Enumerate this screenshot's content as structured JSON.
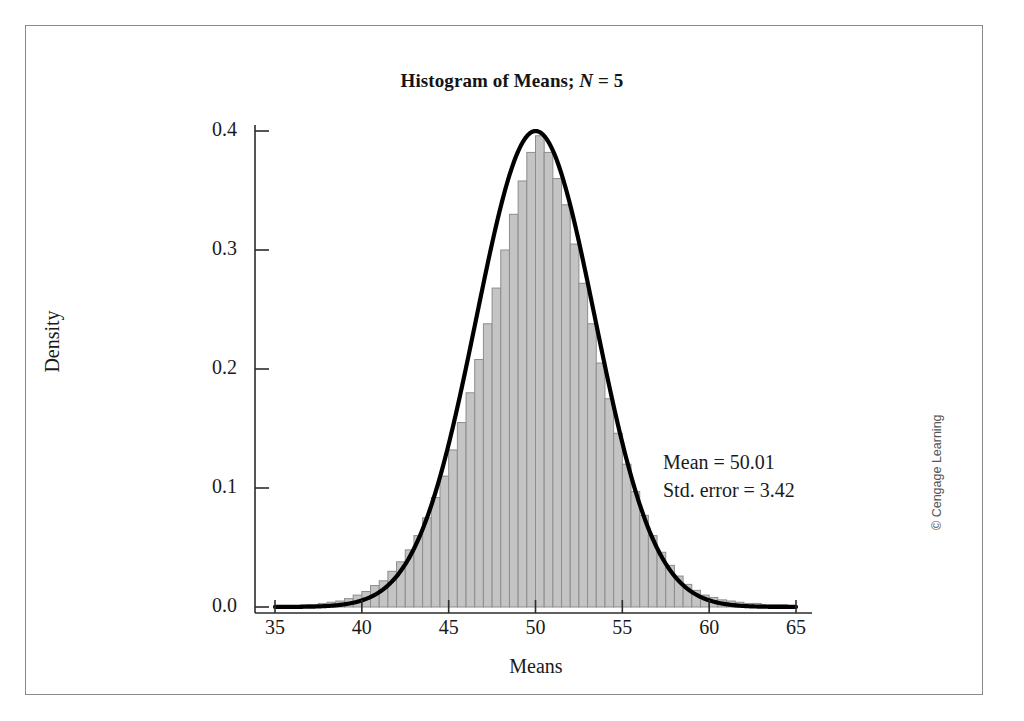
{
  "figure": {
    "copyright": "© Cengage Learning"
  },
  "chart_data": {
    "type": "bar",
    "title": "Histogram of Means; N = 5",
    "title_prefix": "Histogram of Means; ",
    "title_italic_symbol": "N",
    "title_suffix": " = 5",
    "xlabel": "Means",
    "ylabel": "Density",
    "xlim": [
      35,
      65
    ],
    "ylim": [
      0.0,
      0.4
    ],
    "xticks": [
      35,
      40,
      45,
      50,
      55,
      60,
      65
    ],
    "xtick_labels": [
      "35",
      "40",
      "45",
      "50",
      "55",
      "60",
      "65"
    ],
    "yticks": [
      0.0,
      0.1,
      0.2,
      0.3,
      0.4
    ],
    "ytick_labels": [
      "0.0",
      "0.1",
      "0.2",
      "0.3",
      "0.4"
    ],
    "grid": false,
    "legend": null,
    "bar_fill_color": "#c4c4c4",
    "bar_edge_color": "#8d8d8d",
    "curve_color": "#000000",
    "bin_width": 0.5,
    "annotations": [
      "Mean = 50.01",
      "Std. error = 3.42"
    ],
    "mean": 50.01,
    "std_error": 3.42,
    "overlay_curve": {
      "type": "normal-density",
      "mean": 50.01,
      "sd": 3.42,
      "peak_value": 0.4
    },
    "bin_centers": [
      36.75,
      37.25,
      37.75,
      38.25,
      38.75,
      39.25,
      39.75,
      40.25,
      40.75,
      41.25,
      41.75,
      42.25,
      42.75,
      43.25,
      43.75,
      44.25,
      44.75,
      45.25,
      45.75,
      46.25,
      46.75,
      47.25,
      47.75,
      48.25,
      48.75,
      49.25,
      49.75,
      50.25,
      50.75,
      51.25,
      51.75,
      52.25,
      52.75,
      53.25,
      53.75,
      54.25,
      54.75,
      55.25,
      55.75,
      56.25,
      56.75,
      57.25,
      57.75,
      58.25,
      58.75,
      59.25,
      59.75,
      60.25,
      60.75,
      61.25,
      61.75,
      62.25,
      62.75,
      63.25,
      63.75,
      64.25
    ],
    "values": [
      0.002,
      0.002,
      0.003,
      0.004,
      0.005,
      0.007,
      0.01,
      0.013,
      0.018,
      0.022,
      0.03,
      0.038,
      0.048,
      0.06,
      0.075,
      0.092,
      0.11,
      0.132,
      0.155,
      0.18,
      0.208,
      0.238,
      0.268,
      0.3,
      0.33,
      0.358,
      0.382,
      0.396,
      0.382,
      0.36,
      0.338,
      0.305,
      0.272,
      0.238,
      0.205,
      0.175,
      0.146,
      0.12,
      0.097,
      0.077,
      0.06,
      0.046,
      0.035,
      0.026,
      0.019,
      0.014,
      0.01,
      0.008,
      0.006,
      0.005,
      0.004,
      0.003,
      0.003,
      0.002,
      0.002,
      0.002
    ]
  }
}
